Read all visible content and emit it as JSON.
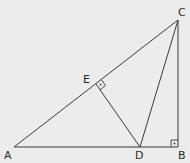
{
  "diagram": {
    "type": "geometry",
    "background": "#ececec",
    "stroke": "#3a3a3a",
    "points": {
      "A": {
        "label": "A",
        "x": 14,
        "y": 147
      },
      "B": {
        "label": "B",
        "x": 178,
        "y": 147
      },
      "C": {
        "label": "C",
        "x": 178,
        "y": 20
      },
      "D": {
        "label": "D",
        "x": 140,
        "y": 147
      },
      "E": {
        "label": "E",
        "x": 96,
        "y": 84
      }
    },
    "segments": [
      "AB",
      "BC",
      "CA",
      "CD",
      "DE"
    ],
    "right_angles": [
      {
        "at": "B",
        "between": [
          "A",
          "C"
        ]
      },
      {
        "at": "E",
        "between": [
          "C",
          "D"
        ]
      }
    ]
  }
}
